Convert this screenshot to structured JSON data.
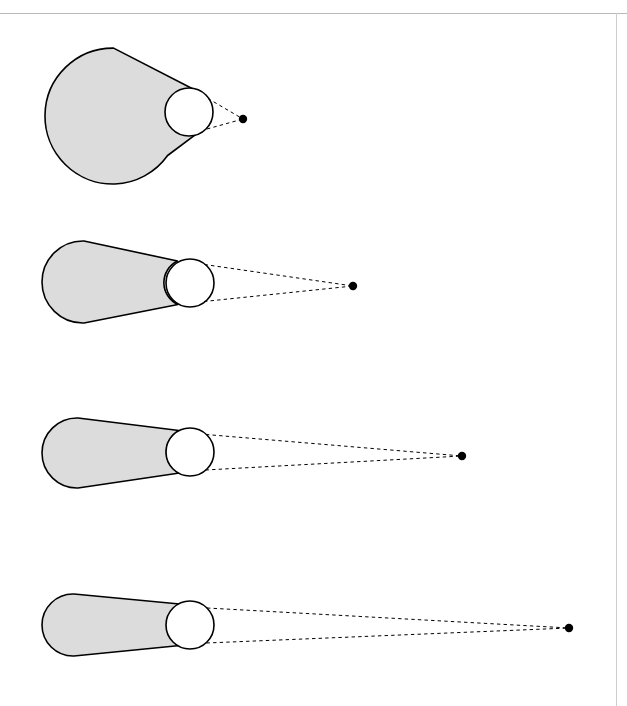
{
  "page": {
    "width": 627,
    "height": 706,
    "background_color": "#ffffff",
    "running_header_text": "",
    "rules": {
      "header_rule_color": "#b9b9b9",
      "margin_rule_color": "#cdcdcd"
    }
  },
  "figure": {
    "caption": "",
    "colors": {
      "hull_fill": "#dcdcdc",
      "hull_stroke": "#000000",
      "circle_fill": "#ffffff",
      "tangent_stroke": "#000000",
      "point_fill": "#000000"
    },
    "panels": [
      {
        "index": 1,
        "label": "",
        "big_circle": {
          "cx": 112,
          "cy": 116,
          "r": 68
        },
        "small_circle": {
          "cx": 189,
          "cy": 112,
          "r": 24
        },
        "apex_point": {
          "x": 243,
          "y": 119,
          "r": 4.2
        },
        "hull_path": "M 189 88 A 24 24 0 0 0 166.6 104 L 166.6 104 A 68 68 0 1 0 175 147 A 24 24 0 0 0 189 136 A 24 24 0 0 1 189 88 Z",
        "outline_path": "M 178.0 89.0 A 68 68 0 1 0 175.5 146.5",
        "tangent_upper": "M 177.5 90.5 L 243 119",
        "tangent_lower": "M 177.0 134.0 L 243 119"
      },
      {
        "index": 2,
        "label": "",
        "big_circle": {
          "cx": 83,
          "cy": 282,
          "r": 41
        },
        "small_circle": {
          "cx": 190,
          "cy": 283,
          "r": 24
        },
        "apex_point": {
          "x": 353,
          "y": 286,
          "r": 4.2
        },
        "tangent_upper": "M 173.5 265.5 L 353 286",
        "tangent_lower": "M 173.0 300.0 L 353 286"
      },
      {
        "index": 3,
        "label": "",
        "big_circle": {
          "cx": 77,
          "cy": 453,
          "r": 35
        },
        "small_circle": {
          "cx": 190,
          "cy": 452,
          "r": 24
        },
        "apex_point": {
          "x": 462,
          "y": 456,
          "r": 4.2
        },
        "tangent_upper": "M 173.0 435.0 L 462 456",
        "tangent_lower": "M 173.0 469.0 L 462 456"
      },
      {
        "index": 4,
        "label": "",
        "big_circle": {
          "cx": 73,
          "cy": 625,
          "r": 31
        },
        "small_circle": {
          "cx": 190,
          "cy": 625,
          "r": 24
        },
        "apex_point": {
          "x": 569,
          "y": 628,
          "r": 4.2
        },
        "tangent_upper": "M 171.5 608.5 L 569 628",
        "tangent_lower": "M 171.5 641.5 L 569 628"
      }
    ]
  }
}
